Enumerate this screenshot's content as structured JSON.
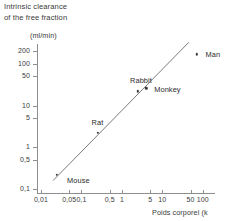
{
  "title": "Intrinsic clearance\nof the free fraction",
  "y_axis_unit": "(ml/min)",
  "x_axis_title": "Poids corporel (k",
  "chart_data": {
    "type": "scatter",
    "title": "Intrinsic clearance of the free fraction",
    "xlabel": "Poids corporel (k",
    "ylabel": "(ml/min)",
    "xscale": "log",
    "yscale": "log",
    "grid": false,
    "legend": false,
    "xlim": [
      0.008,
      200
    ],
    "ylim": [
      0.08,
      300
    ],
    "xticks": [
      "0,01",
      "0,05",
      "0,1",
      "0,5",
      "1",
      "5",
      "10",
      "50",
      "100"
    ],
    "xtick_values": [
      0.01,
      0.05,
      0.1,
      0.5,
      1,
      5,
      10,
      50,
      100
    ],
    "yticks": [
      "200",
      "100",
      "50",
      "10",
      "5",
      "1",
      "0,5",
      "0,1"
    ],
    "ytick_values": [
      200,
      100,
      50,
      10,
      5,
      1,
      0.5,
      0.1
    ],
    "points": [
      {
        "label": "Mouse",
        "x": 0.025,
        "y": 0.22,
        "label_dx": 10,
        "label_dy": 6
      },
      {
        "label": "Rat",
        "x": 0.25,
        "y": 2.2,
        "label_dx": -6,
        "label_dy": -10
      },
      {
        "label": "Rabbit",
        "x": 2.5,
        "y": 22,
        "label_dx": -8,
        "label_dy": -10
      },
      {
        "label": "Monkey",
        "x": 4.0,
        "y": 26,
        "label_dx": 8,
        "label_dy": 2
      },
      {
        "label": "Man",
        "x": 70,
        "y": 170,
        "label_dx": 9,
        "label_dy": 1
      }
    ],
    "fit_line": {
      "type": "allometric-regression",
      "x_start": 0.02,
      "y_start": 0.16,
      "x_end": 45,
      "y_end": 330
    },
    "annotations": [
      "Mouse",
      "Rat",
      "Rabbit",
      "Monkey",
      "Man"
    ]
  }
}
